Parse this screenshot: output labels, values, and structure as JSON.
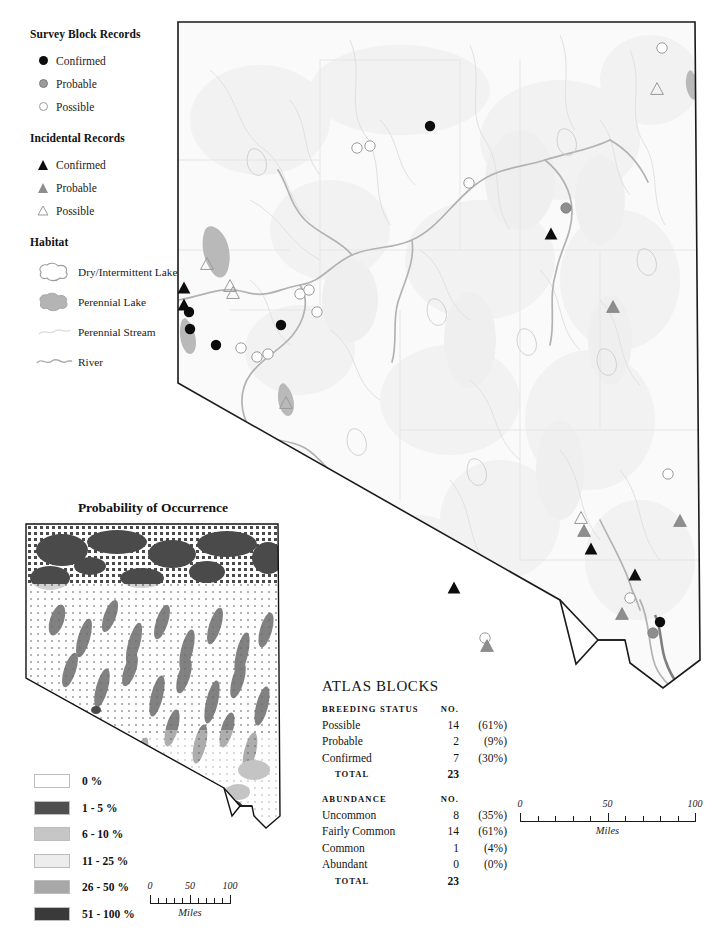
{
  "legend": {
    "sections": [
      {
        "title": "Survey Block Records",
        "items": [
          {
            "symbol": "dot-confirmed",
            "label": "Confirmed"
          },
          {
            "symbol": "dot-probable",
            "label": "Probable"
          },
          {
            "symbol": "dot-possible",
            "label": "Possible"
          }
        ]
      },
      {
        "title": "Incidental Records",
        "items": [
          {
            "symbol": "triangle-confirmed",
            "label": "Confirmed"
          },
          {
            "symbol": "triangle-probable",
            "label": "Probable"
          },
          {
            "symbol": "triangle-possible",
            "label": "Possible"
          }
        ]
      }
    ],
    "habitat": {
      "title": "Habitat",
      "items": [
        {
          "symbol": "dry-lake-icon",
          "label": "Dry/Intermittent Lake"
        },
        {
          "symbol": "perennial-lake-icon",
          "label": "Perennial Lake"
        },
        {
          "symbol": "perennial-stream-icon",
          "label": "Perennial Stream"
        },
        {
          "symbol": "river-icon",
          "label": "River"
        }
      ]
    }
  },
  "inset": {
    "title": "Probability of Occurrence",
    "legend_title": "Probability of Occurrence",
    "classes": [
      {
        "label": "0 %",
        "color": "#ffffff"
      },
      {
        "label": "1 - 5 %",
        "color": "#4f4f4f"
      },
      {
        "label": "6 - 10 %",
        "color": "#c6c6c6"
      },
      {
        "label": "11 - 25 %",
        "color": "#ededed"
      },
      {
        "label": "26 - 50 %",
        "color": "#a8a8a8"
      },
      {
        "label": "51 - 100 %",
        "color": "#3a3a3a"
      }
    ],
    "scale": {
      "unit": "Miles",
      "labels": [
        "0",
        "50",
        "100"
      ],
      "values": [
        0,
        50,
        100
      ]
    }
  },
  "main_map": {
    "scale": {
      "unit": "Miles",
      "labels": [
        "0",
        "50",
        "100"
      ],
      "values": [
        0,
        50,
        100
      ]
    },
    "markers": [
      {
        "type": "dot-confirmed",
        "x": 430,
        "y": 126
      },
      {
        "type": "dot-possible",
        "x": 357,
        "y": 148
      },
      {
        "type": "dot-possible",
        "x": 370,
        "y": 146
      },
      {
        "type": "dot-possible",
        "x": 469,
        "y": 183
      },
      {
        "type": "dot-possible",
        "x": 662,
        "y": 48
      },
      {
        "type": "triangle-possible",
        "x": 657,
        "y": 89
      },
      {
        "type": "dot-probable",
        "x": 566,
        "y": 208
      },
      {
        "type": "triangle-confirmed",
        "x": 551,
        "y": 234
      },
      {
        "type": "triangle-possible",
        "x": 207,
        "y": 264
      },
      {
        "type": "triangle-confirmed",
        "x": 184,
        "y": 288
      },
      {
        "type": "triangle-possible",
        "x": 230,
        "y": 286
      },
      {
        "type": "triangle-possible",
        "x": 233,
        "y": 293
      },
      {
        "type": "triangle-confirmed",
        "x": 184,
        "y": 305
      },
      {
        "type": "dot-confirmed",
        "x": 189,
        "y": 312
      },
      {
        "type": "dot-possible",
        "x": 300,
        "y": 294
      },
      {
        "type": "dot-possible",
        "x": 309,
        "y": 290
      },
      {
        "type": "dot-possible",
        "x": 317,
        "y": 312
      },
      {
        "type": "dot-confirmed",
        "x": 190,
        "y": 329
      },
      {
        "type": "dot-confirmed",
        "x": 281,
        "y": 325
      },
      {
        "type": "dot-confirmed",
        "x": 216,
        "y": 345
      },
      {
        "type": "dot-possible",
        "x": 241,
        "y": 348
      },
      {
        "type": "dot-possible",
        "x": 257,
        "y": 357
      },
      {
        "type": "dot-possible",
        "x": 268,
        "y": 354
      },
      {
        "type": "triangle-probable",
        "x": 613,
        "y": 307
      },
      {
        "type": "triangle-possible",
        "x": 286,
        "y": 403
      },
      {
        "type": "dot-possible",
        "x": 668,
        "y": 474
      },
      {
        "type": "triangle-possible",
        "x": 581,
        "y": 518
      },
      {
        "type": "triangle-probable",
        "x": 584,
        "y": 531
      },
      {
        "type": "triangle-probable",
        "x": 680,
        "y": 521
      },
      {
        "type": "triangle-confirmed",
        "x": 591,
        "y": 549
      },
      {
        "type": "triangle-confirmed",
        "x": 454,
        "y": 588
      },
      {
        "type": "triangle-confirmed",
        "x": 635,
        "y": 575
      },
      {
        "type": "dot-possible",
        "x": 630,
        "y": 598
      },
      {
        "type": "dot-possible",
        "x": 485,
        "y": 638
      },
      {
        "type": "triangle-probable",
        "x": 487,
        "y": 646
      },
      {
        "type": "triangle-probable",
        "x": 622,
        "y": 614
      },
      {
        "type": "dot-confirmed",
        "x": 660,
        "y": 622
      },
      {
        "type": "dot-probable",
        "x": 653,
        "y": 633
      }
    ]
  },
  "atlas": {
    "title": "ATLAS BLOCKS",
    "sections": [
      {
        "header": "BREEDING STATUS",
        "num_header": "NO.",
        "rows": [
          {
            "label": "Possible",
            "no": "14",
            "pct": "(61%)"
          },
          {
            "label": "Probable",
            "no": "2",
            "pct": "(9%)"
          },
          {
            "label": "Confirmed",
            "no": "7",
            "pct": "(30%)"
          }
        ],
        "total_label": "TOTAL",
        "total_no": "23"
      },
      {
        "header": "ABUNDANCE",
        "num_header": "NO.",
        "rows": [
          {
            "label": "Uncommon",
            "no": "8",
            "pct": "(35%)"
          },
          {
            "label": "Fairly Common",
            "no": "14",
            "pct": "(61%)"
          },
          {
            "label": "Common",
            "no": "1",
            "pct": "(4%)"
          },
          {
            "label": "Abundant",
            "no": "0",
            "pct": "(0%)"
          }
        ],
        "total_label": "TOTAL",
        "total_no": "23"
      }
    ]
  },
  "colors": {
    "confirmed": "#0d0d0d",
    "probable": "#8e8e8e",
    "possible": "#ffffff",
    "possible_stroke": "#9b9b9b",
    "state_outline": "#1a1a1a",
    "perennial_lake": "#b9b9b9",
    "river": "#b4b4b4",
    "stream": "#d8d8d8",
    "county": "#e2e2e2",
    "terrain": "#f4f4f4"
  }
}
